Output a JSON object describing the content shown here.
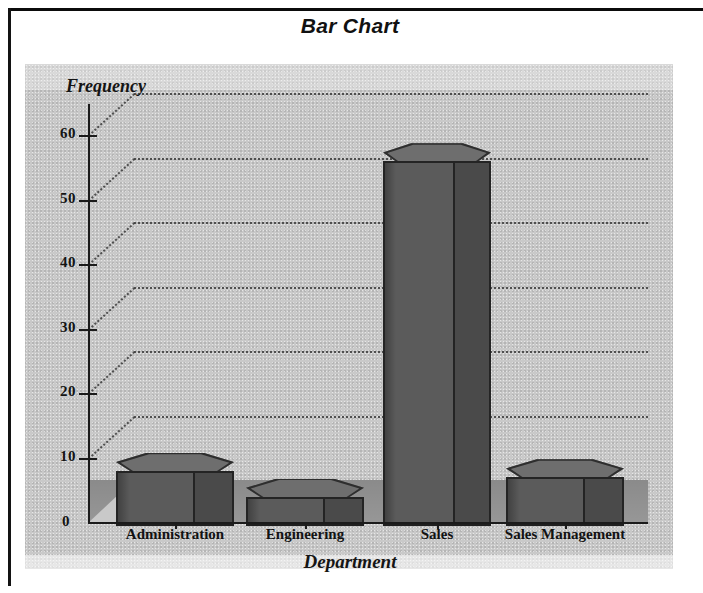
{
  "title": "Bar Chart",
  "axis": {
    "ylabel": "Frequency",
    "xlabel": "Department",
    "zero_tick": "0"
  },
  "yticks": [
    "60",
    "50",
    "40",
    "30",
    "20",
    "10"
  ],
  "chart_data": {
    "type": "bar",
    "title": "Bar Chart",
    "xlabel": "Department",
    "ylabel": "Frequency",
    "categories": [
      "Administration",
      "Engineering",
      "Sales",
      "Sales Management"
    ],
    "values": [
      8,
      4,
      56,
      7
    ],
    "ylim": [
      0,
      65
    ],
    "ytick_values": [
      10,
      20,
      30,
      40,
      50,
      60
    ],
    "grid": true,
    "legend": "none",
    "style": "3d-hexagonal-prism",
    "colors": {
      "bar_top": "#6e6e6e",
      "bar_front": "#5b5b5b",
      "bar_side": "#4a4a4a",
      "bar_outline": "#242424",
      "panel_background": "#c9c9c9",
      "floor": "#9a9a9a",
      "gridline": "#3a3a3a",
      "text": "#121212"
    }
  }
}
